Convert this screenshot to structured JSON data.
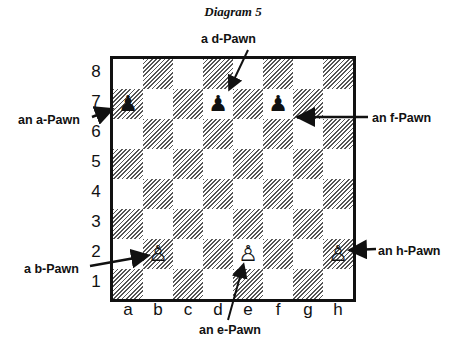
{
  "title": "Diagram 5",
  "ranks": [
    "8",
    "7",
    "6",
    "5",
    "4",
    "3",
    "2",
    "1"
  ],
  "files": [
    "a",
    "b",
    "c",
    "d",
    "e",
    "f",
    "g",
    "h"
  ],
  "pieces": [
    {
      "square": "a7",
      "color": "black",
      "glyph": "♟"
    },
    {
      "square": "d7",
      "color": "black",
      "glyph": "♟"
    },
    {
      "square": "f7",
      "color": "black",
      "glyph": "♟"
    },
    {
      "square": "b2",
      "color": "white",
      "glyph": "♙"
    },
    {
      "square": "e2",
      "color": "white",
      "glyph": "♙"
    },
    {
      "square": "h2",
      "color": "white",
      "glyph": "♙"
    }
  ],
  "labels": {
    "a_pawn": "an a-Pawn",
    "b_pawn": "a b-Pawn",
    "d_pawn": "a d-Pawn",
    "e_pawn": "an e-Pawn",
    "f_pawn": "an f-Pawn",
    "h_pawn": "an h-Pawn"
  }
}
